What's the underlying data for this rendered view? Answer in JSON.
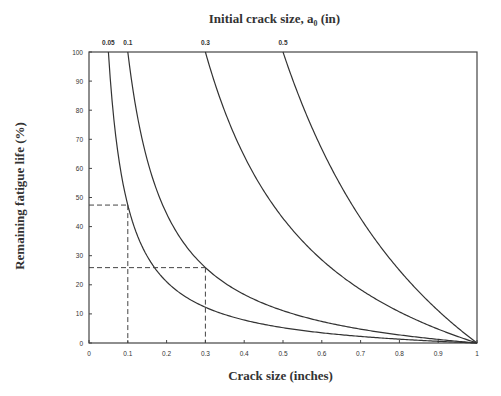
{
  "chart_data": {
    "type": "line",
    "title_display": "Initial crack size, a₀ (in)",
    "xlabel": "Crack size (inches)",
    "ylabel": "Remaining fatigue life (%)",
    "xlim": [
      0,
      1
    ],
    "ylim": [
      0,
      100
    ],
    "x_ticks": [
      "0",
      "0.1",
      "0.2",
      "0.3",
      "0.4",
      "0.5",
      "0.6",
      "0.7",
      "0.8",
      "0.9",
      "1"
    ],
    "y_ticks": [
      "0",
      "10",
      "20",
      "30",
      "40",
      "50",
      "60",
      "70",
      "80",
      "90",
      "100"
    ],
    "grid": false,
    "series_labels_position": "top",
    "x": [
      0.05,
      0.1,
      0.15,
      0.2,
      0.3,
      0.4,
      0.5,
      0.6,
      0.7,
      0.8,
      0.9,
      1.0
    ],
    "series": [
      {
        "name": "0.05",
        "a0": 0.05,
        "values": [
          100,
          47.4,
          29.8,
          21.1,
          12.3,
          7.9,
          5.3,
          3.5,
          2.3,
          1.3,
          0.6,
          0
        ]
      },
      {
        "name": "0.1",
        "a0": 0.1,
        "values": [
          null,
          100,
          63.0,
          44.4,
          25.9,
          16.7,
          11.1,
          7.4,
          4.8,
          2.8,
          1.2,
          0
        ]
      },
      {
        "name": "0.3",
        "a0": 0.3,
        "values": [
          null,
          null,
          null,
          null,
          100,
          64.3,
          42.9,
          28.6,
          18.4,
          10.7,
          4.8,
          0
        ]
      },
      {
        "name": "0.5",
        "a0": 0.5,
        "values": [
          null,
          null,
          null,
          null,
          null,
          null,
          100,
          66.7,
          42.9,
          25.0,
          11.1,
          0
        ]
      }
    ],
    "annotations": [
      {
        "type": "dashed-guide",
        "x": 0.1,
        "y": 47.4,
        "note": "a0=0.05 curve at a=0.1"
      },
      {
        "type": "dashed-guide",
        "x": 0.3,
        "y": 25.9,
        "note": "a0=0.1 curve at a=0.3"
      }
    ]
  },
  "labels": {
    "title": "Initial crack size, a₀ (in)",
    "xlabel": "Crack size (inches)",
    "ylabel": "Remaining fatigue life (%)"
  },
  "style": {
    "line_color": "#333333",
    "axis_color": "#444444",
    "background": "#ffffff"
  }
}
